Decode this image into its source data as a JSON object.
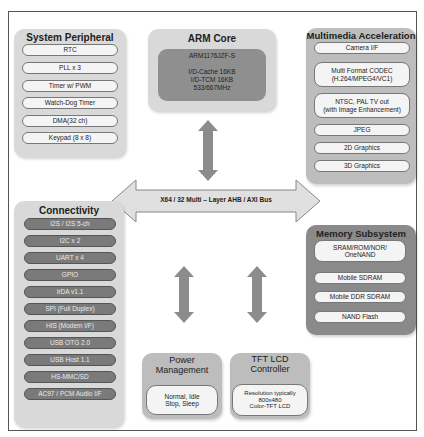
{
  "diagram": {
    "bus": {
      "label": "X64 / 32 Multi – Layer AHB / AXI Bus"
    },
    "system_peripheral": {
      "title": "System Peripheral",
      "items": [
        "RTC",
        "PLL x 3",
        "Timer w/ PWM",
        "Watch-Dog Timer",
        "DMA(32 ch)",
        "Keypad (8 x 8)"
      ]
    },
    "arm_core": {
      "title": "ARM Core",
      "lines": [
        "ARM1176JZF-S",
        "",
        "I/D-Cache 16KB",
        "I/D-TCM 16KB",
        "533/667MHz"
      ]
    },
    "multimedia": {
      "title": "Multimedia Acceleration",
      "items": [
        "Camera I/F",
        "Multi Format CODEC\n(H.264/MPEG4/VC1)",
        "NTSC, PAL TV out\n(with Image Enhancement)",
        "JPEG",
        "2D Graphics",
        "3D Graphics"
      ]
    },
    "connectivity": {
      "title": "Connectivity",
      "items": [
        "I2S / I2S 5-ch",
        "I2C x 2",
        "UART x 4",
        "GPIO",
        "IrDA v1.1",
        "SPI (Full Duplex)",
        "HIS (Modem I/F)",
        "USB OTG 2.0",
        "USB Host 1.1",
        "HS-MMC/SD",
        "AC97 / PCM Audio I/F"
      ]
    },
    "memory": {
      "title": "Memory Subsystem",
      "items": [
        "SRAM/ROM/NOR/\nOneNAND",
        "Mobile SDRAM",
        "Mobile DDR SDRAM",
        "NAND Flash"
      ]
    },
    "power": {
      "title_lines": [
        "Power",
        "Management"
      ],
      "content_lines": [
        "Normal, Idle",
        "Stop, Sleep"
      ]
    },
    "lcd": {
      "title_lines": [
        "TFT LCD",
        "Controller"
      ],
      "content_lines": [
        "Resolution typically",
        "800x480",
        "Color-TFT LCD"
      ]
    }
  },
  "colors": {
    "panel_light": "#d9d9d9",
    "panel_mid": "#bdbdbd",
    "panel_dark": "#8a8a8a",
    "arrow": "#8c8c8c",
    "bus": "#e0e0e0"
  }
}
